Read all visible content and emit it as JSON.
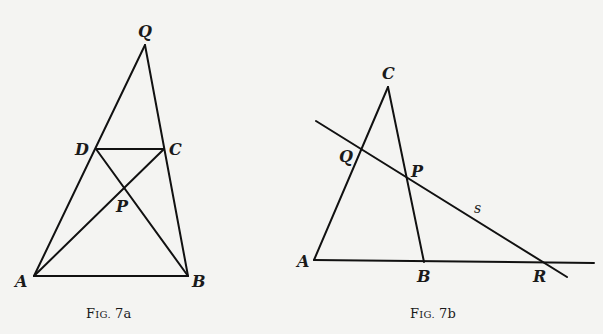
{
  "figures": [
    {
      "id": "fig7a",
      "caption": "Fig. 7a",
      "caption_display": {
        "F": "F",
        "IG": "IG.",
        "num": "7a"
      },
      "points": {
        "Q": {
          "label": "Q",
          "x": 145,
          "y": 45
        },
        "D": {
          "label": "D",
          "x": 96,
          "y": 149
        },
        "C": {
          "label": "C",
          "x": 164,
          "y": 149
        },
        "P": {
          "label": "P",
          "x": 125,
          "y": 189
        },
        "A": {
          "label": "A",
          "x": 34,
          "y": 276
        },
        "B": {
          "label": "B",
          "x": 188,
          "y": 276
        }
      },
      "segments": [
        [
          "Q",
          "A"
        ],
        [
          "Q",
          "B"
        ],
        [
          "A",
          "B"
        ],
        [
          "D",
          "C"
        ],
        [
          "D",
          "B"
        ],
        [
          "A",
          "C"
        ]
      ]
    },
    {
      "id": "fig7b",
      "caption": "Fig. 7b",
      "caption_display": {
        "F": "F",
        "IG": "IG.",
        "num": "7b"
      },
      "points": {
        "C": {
          "label": "C",
          "x": 388,
          "y": 87
        },
        "Q": {
          "label": "Q",
          "x": 361,
          "y": 150
        },
        "P": {
          "label": "P",
          "x": 408,
          "y": 177
        },
        "A": {
          "label": "A",
          "x": 314,
          "y": 260
        },
        "B": {
          "label": "B",
          "x": 424,
          "y": 262
        },
        "R": {
          "label": "R",
          "x": 542,
          "y": 263
        }
      },
      "line_label": "s",
      "segments": [
        [
          "C",
          "A"
        ],
        [
          "C",
          "B"
        ],
        [
          "A",
          "R+"
        ],
        [
          "s-start",
          "s-end"
        ]
      ]
    }
  ]
}
